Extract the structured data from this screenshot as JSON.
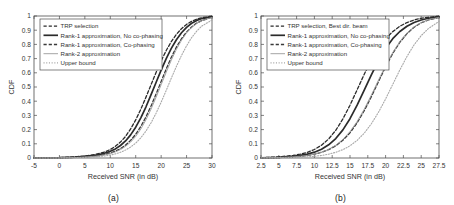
{
  "figure": {
    "background": "#ffffff",
    "axis_color": "#4d4d4d",
    "text_color": "#333333",
    "curve_color": "#2b2b2b",
    "curve_color_light": "#8c8c8c"
  },
  "subplots": [
    {
      "caption": "(a)",
      "chart_data": {
        "type": "line",
        "title": "",
        "xlabel": "Received SNR (in dB)",
        "ylabel": "CDF",
        "xlim": [
          -5,
          30
        ],
        "ylim": [
          0,
          1
        ],
        "xticks": [
          -5,
          0,
          5,
          10,
          15,
          20,
          25,
          30
        ],
        "xticklabels": [
          "-5",
          "0",
          "5",
          "10",
          "15",
          "20",
          "25",
          "30"
        ],
        "yticks": [
          0,
          0.1,
          0.2,
          0.3,
          0.4,
          0.5,
          0.6,
          0.7,
          0.8,
          0.9,
          1
        ],
        "yticklabels": [
          "0",
          "0.1",
          "0.2",
          "0.3",
          "0.4",
          "0.5",
          "0.6",
          "0.7",
          "0.8",
          "0.9",
          "1"
        ],
        "grid": false,
        "legend_position": "upper left",
        "series": [
          {
            "name": "TRP selection",
            "style": "dashed",
            "width": 1.3,
            "color": "#2b2b2b",
            "x": [
              -5,
              0,
              3,
              5,
              7,
              8,
              9,
              10,
              11,
              12,
              13,
              14,
              15,
              16,
              17,
              18,
              19,
              20,
              21,
              22,
              23,
              24,
              25,
              26,
              27,
              28,
              30
            ],
            "y": [
              0,
              0.003,
              0.008,
              0.014,
              0.025,
              0.033,
              0.044,
              0.06,
              0.082,
              0.112,
              0.152,
              0.205,
              0.268,
              0.343,
              0.427,
              0.515,
              0.602,
              0.684,
              0.757,
              0.82,
              0.871,
              0.911,
              0.941,
              0.963,
              0.978,
              0.988,
              0.998
            ]
          },
          {
            "name": "Rank-1 approximation, No co-phasing",
            "style": "solid",
            "width": 1.7,
            "color": "#2b2b2b",
            "x": [
              -5,
              0,
              3,
              5,
              7,
              8,
              9,
              10,
              11,
              12,
              13,
              14,
              15,
              16,
              17,
              18,
              19,
              20,
              21,
              22,
              23,
              24,
              25,
              26,
              27,
              28,
              30
            ],
            "y": [
              0,
              0.002,
              0.006,
              0.011,
              0.019,
              0.026,
              0.035,
              0.047,
              0.064,
              0.088,
              0.12,
              0.163,
              0.217,
              0.283,
              0.359,
              0.444,
              0.532,
              0.619,
              0.7,
              0.772,
              0.833,
              0.882,
              0.92,
              0.949,
              0.969,
              0.982,
              0.996
            ]
          },
          {
            "name": "Rank-1 approximation, Co-phasing",
            "style": "dashed",
            "width": 1.3,
            "color": "#3a3a3a",
            "x": [
              -5,
              0,
              3,
              5,
              7,
              8,
              9,
              10,
              11,
              12,
              13,
              14,
              15,
              16,
              17,
              18,
              19,
              20,
              21,
              22,
              23,
              24,
              25,
              26,
              27,
              28,
              30
            ],
            "y": [
              0,
              0.001,
              0.004,
              0.008,
              0.014,
              0.019,
              0.026,
              0.035,
              0.048,
              0.066,
              0.091,
              0.124,
              0.167,
              0.222,
              0.288,
              0.365,
              0.45,
              0.539,
              0.627,
              0.709,
              0.781,
              0.84,
              0.887,
              0.923,
              0.95,
              0.968,
              0.991
            ]
          },
          {
            "name": "Rank-2 approximation",
            "style": "solid",
            "width": 0.9,
            "color": "#9a9a9a",
            "x": [
              -5,
              0,
              3,
              5,
              7,
              8,
              9,
              10,
              11,
              12,
              13,
              14,
              15,
              16,
              17,
              18,
              19,
              20,
              21,
              22,
              23,
              24,
              25,
              26,
              27,
              28,
              30
            ],
            "y": [
              0,
              0.001,
              0.003,
              0.007,
              0.012,
              0.017,
              0.023,
              0.031,
              0.043,
              0.059,
              0.082,
              0.112,
              0.152,
              0.204,
              0.268,
              0.343,
              0.427,
              0.516,
              0.604,
              0.689,
              0.765,
              0.829,
              0.881,
              0.92,
              0.948,
              0.967,
              0.99
            ]
          },
          {
            "name": "Upper bound",
            "style": "dotted",
            "width": 1.1,
            "color": "#a8a8a8",
            "x": [
              -5,
              0,
              3,
              5,
              7,
              8,
              9,
              10,
              11,
              12,
              13,
              14,
              15,
              16,
              17,
              18,
              19,
              20,
              21,
              22,
              23,
              24,
              25,
              26,
              27,
              28,
              30
            ],
            "y": [
              0,
              0.0005,
              0.002,
              0.004,
              0.008,
              0.011,
              0.015,
              0.021,
              0.029,
              0.04,
              0.056,
              0.077,
              0.105,
              0.142,
              0.189,
              0.247,
              0.315,
              0.393,
              0.476,
              0.562,
              0.645,
              0.722,
              0.79,
              0.848,
              0.894,
              0.929,
              0.972
            ]
          }
        ]
      }
    },
    {
      "caption": "(b)",
      "chart_data": {
        "type": "line",
        "title": "",
        "xlabel": "Received SNR (in dB)",
        "ylabel": "CDF",
        "xlim": [
          2.5,
          27.5
        ],
        "ylim": [
          0,
          1
        ],
        "xticks": [
          2.5,
          5,
          7.5,
          10,
          12.5,
          15,
          17.5,
          20,
          22.5,
          25,
          27.5
        ],
        "xticklabels": [
          "2.5",
          "5",
          "7.5",
          "10",
          "12.5",
          "15",
          "17.5",
          "20",
          "22.5",
          "25",
          "27.5"
        ],
        "yticks": [
          0,
          0.1,
          0.2,
          0.3,
          0.4,
          0.5,
          0.6,
          0.7,
          0.8,
          0.9,
          1
        ],
        "yticklabels": [
          "0",
          "0.1",
          "0.2",
          "0.3",
          "0.4",
          "0.5",
          "0.6",
          "0.7",
          "0.8",
          "0.9",
          "1"
        ],
        "grid": false,
        "legend_position": "upper left",
        "series": [
          {
            "name": "TRP selection, Best dir. beam",
            "style": "dashed",
            "width": 1.3,
            "color": "#2b2b2b",
            "x": [
              2.5,
              5,
              7,
              8,
              9,
              10,
              11,
              12,
              13,
              14,
              15,
              16,
              17,
              18,
              19,
              20,
              21,
              22,
              23,
              24,
              25,
              26,
              27.5
            ],
            "y": [
              0.002,
              0.008,
              0.018,
              0.027,
              0.04,
              0.06,
              0.09,
              0.134,
              0.195,
              0.275,
              0.372,
              0.48,
              0.59,
              0.69,
              0.775,
              0.84,
              0.89,
              0.928,
              0.954,
              0.972,
              0.984,
              0.991,
              0.998
            ]
          },
          {
            "name": "Rank-1 approximation, No co-phasing",
            "style": "solid",
            "width": 1.7,
            "color": "#2b2b2b",
            "x": [
              2.5,
              5,
              7,
              8,
              9,
              10,
              11,
              12,
              13,
              14,
              15,
              16,
              17,
              18,
              19,
              20,
              21,
              22,
              23,
              24,
              25,
              26,
              27.5
            ],
            "y": [
              0.001,
              0.005,
              0.012,
              0.018,
              0.027,
              0.041,
              0.062,
              0.093,
              0.137,
              0.198,
              0.277,
              0.372,
              0.478,
              0.586,
              0.686,
              0.772,
              0.84,
              0.891,
              0.928,
              0.954,
              0.972,
              0.984,
              0.995
            ]
          },
          {
            "name": "Rank-1 approximation, Co-phasing",
            "style": "dashed",
            "width": 1.3,
            "color": "#3a3a3a",
            "x": [
              2.5,
              5,
              7,
              8,
              9,
              10,
              11,
              12,
              13,
              14,
              15,
              16,
              17,
              18,
              19,
              20,
              21,
              22,
              23,
              24,
              25,
              26,
              27.5
            ],
            "y": [
              0.0008,
              0.003,
              0.008,
              0.012,
              0.018,
              0.027,
              0.04,
              0.059,
              0.086,
              0.125,
              0.178,
              0.247,
              0.333,
              0.432,
              0.538,
              0.642,
              0.736,
              0.815,
              0.876,
              0.921,
              0.952,
              0.972,
              0.99
            ]
          },
          {
            "name": "Rank-2 approximation",
            "style": "solid",
            "width": 0.9,
            "color": "#9a9a9a",
            "x": [
              2.5,
              5,
              7,
              8,
              9,
              10,
              11,
              12,
              13,
              14,
              15,
              16,
              17,
              18,
              19,
              20,
              21,
              22,
              23,
              24,
              25,
              26,
              27.5
            ],
            "y": [
              0.0008,
              0.003,
              0.008,
              0.012,
              0.018,
              0.027,
              0.041,
              0.061,
              0.09,
              0.131,
              0.186,
              0.257,
              0.344,
              0.443,
              0.548,
              0.65,
              0.742,
              0.82,
              0.879,
              0.924,
              0.954,
              0.973,
              0.991
            ]
          },
          {
            "name": "Upper bound",
            "style": "dotted",
            "width": 1.1,
            "color": "#a8a8a8",
            "x": [
              2.5,
              5,
              7,
              8,
              9,
              10,
              11,
              12,
              13,
              14,
              15,
              16,
              17,
              18,
              19,
              20,
              21,
              22,
              23,
              24,
              25,
              26,
              27.5
            ],
            "y": [
              0.0003,
              0.0012,
              0.003,
              0.005,
              0.008,
              0.012,
              0.018,
              0.027,
              0.04,
              0.059,
              0.086,
              0.124,
              0.175,
              0.241,
              0.322,
              0.416,
              0.518,
              0.62,
              0.715,
              0.797,
              0.862,
              0.911,
              0.962
            ]
          }
        ]
      }
    }
  ]
}
